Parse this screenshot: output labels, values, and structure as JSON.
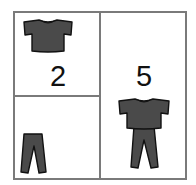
{
  "figure": {
    "cells": [
      {
        "id": "shirt-cell",
        "items": [
          "shirt"
        ],
        "label": "2"
      },
      {
        "id": "pants-cell",
        "items": [
          "pants"
        ],
        "label": ""
      },
      {
        "id": "outfit-cell",
        "items": [
          "shirt",
          "pants"
        ],
        "label": "5"
      }
    ],
    "colors": {
      "border": "#7a7a7a",
      "garment_fill": "#4a4a4a",
      "garment_outline": "#111111",
      "text": "#111111"
    }
  }
}
